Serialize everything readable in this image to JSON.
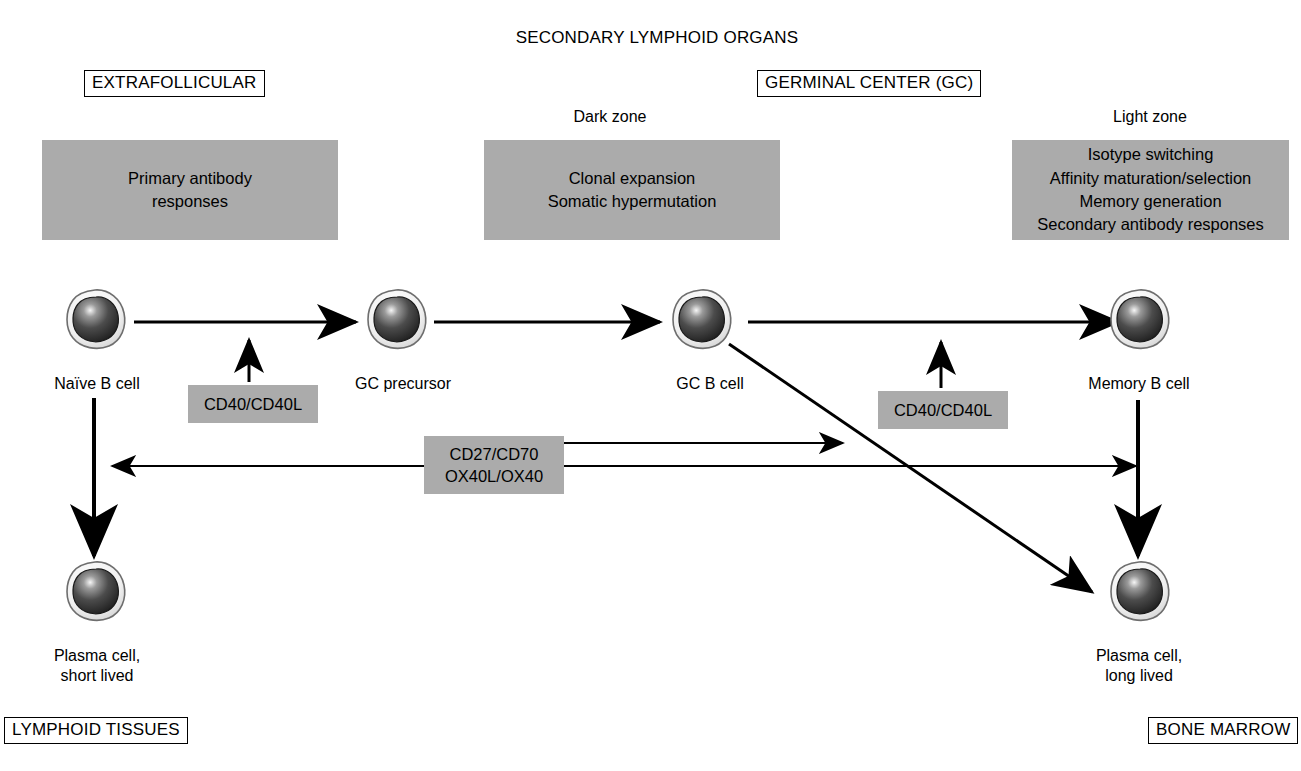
{
  "figure": {
    "header_title": "SECONDARY LYMPHOID ORGANS",
    "compartment_left": "EXTRAFOLLICULAR",
    "compartment_center": "GERMINAL CENTER (GC)",
    "compartment_bottom_left": "LYMPHOID TISSUES",
    "compartment_bottom_right": "BONE MARROW",
    "zone_dark": "Dark zone",
    "zone_light": "Light zone"
  },
  "panels": {
    "extrafollicular": {
      "line1": "Primary antibody",
      "line2": "responses"
    },
    "dark_zone": {
      "line1": "Clonal expansion",
      "line2": "Somatic hypermutation"
    },
    "light_zone": {
      "line1": "Isotype switching",
      "line2": "Affinity maturation/selection",
      "line3": "Memory generation",
      "line4": "Secondary antibody responses"
    }
  },
  "signals": {
    "cd40_left": "CD40/CD40L",
    "cd40_right": "CD40/CD40L",
    "costim_line1": "CD27/CD70",
    "costim_line2": "OX40L/OX40"
  },
  "cells": [
    {
      "id": "naive-b-cell",
      "label": "Naïve B cell"
    },
    {
      "id": "gc-precursor",
      "label": "GC precursor"
    },
    {
      "id": "gc-b-cell",
      "label": "GC B cell"
    },
    {
      "id": "memory-b-cell",
      "label": "Memory B cell"
    },
    {
      "id": "plasma-cell-short",
      "label_line1": "Plasma cell,",
      "label_line2": "short lived"
    },
    {
      "id": "plasma-cell-long",
      "label_line1": "Plasma cell,",
      "label_line2": "long lived"
    }
  ],
  "colors": {
    "panel_grey": "#ababab",
    "ink": "#000000",
    "background": "#ffffff",
    "nucleus_dark": "#3a3a3a",
    "cytoplasm_light": "#f2f2f2"
  }
}
